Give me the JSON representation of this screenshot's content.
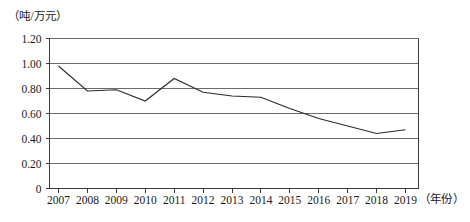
{
  "chart_data": {
    "type": "line",
    "title": "",
    "subtitle": "",
    "xlabel": "（年份）",
    "ylabel": "（吨/万元）",
    "categories": [
      "2007",
      "2008",
      "2009",
      "2010",
      "2011",
      "2012",
      "2013",
      "2014",
      "2015",
      "2016",
      "2017",
      "2018",
      "2019"
    ],
    "x": [
      2007,
      2008,
      2009,
      2010,
      2011,
      2012,
      2013,
      2014,
      2015,
      2016,
      2017,
      2018,
      2019
    ],
    "values": [
      0.98,
      0.78,
      0.79,
      0.7,
      0.88,
      0.77,
      0.74,
      0.73,
      0.64,
      0.56,
      0.5,
      0.44,
      0.47
    ],
    "series": [
      {
        "name": "单位万元产值能耗",
        "color": "#2b2b2b",
        "values": [
          0.98,
          0.78,
          0.79,
          0.7,
          0.88,
          0.77,
          0.74,
          0.73,
          0.64,
          0.56,
          0.5,
          0.44,
          0.47
        ]
      }
    ],
    "ylim": [
      0,
      1.2
    ],
    "yticks": [
      0,
      0.2,
      0.4,
      0.6,
      0.8,
      1.0,
      1.2
    ],
    "ytick_labels": [
      "0",
      "0.20",
      "0.40",
      "0.60",
      "0.80",
      "1.00",
      "1.20"
    ],
    "xtick_labels": [
      "2007",
      "2008",
      "2009",
      "2010",
      "2011",
      "2012",
      "2013",
      "2014",
      "2015",
      "2016",
      "2017",
      "2018",
      "2019"
    ],
    "grid": true,
    "grid_axis": "y",
    "legend": false,
    "legend_position": "none",
    "markers": false,
    "annotations": []
  },
  "axes": {
    "y_unit": "（吨/万元）",
    "x_unit": "（年份）",
    "y_labels": [
      "1.20",
      "1.00",
      "0.80",
      "0.60",
      "0.40",
      "0.20",
      "0"
    ],
    "x_labels": [
      "2007",
      "2008",
      "2009",
      "2010",
      "2011",
      "2012",
      "2013",
      "2014",
      "2015",
      "2016",
      "2017",
      "2018",
      "2019"
    ]
  },
  "colors": {
    "line": "#2b2b2b",
    "grid": "#6b6b6b",
    "axis": "#3a3a3a",
    "text": "#1a1a1a",
    "background": "#ffffff"
  }
}
